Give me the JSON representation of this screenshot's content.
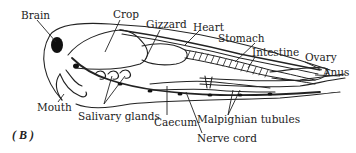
{
  "figure": {
    "panel_label": "( B )"
  },
  "labels": {
    "brain": "Brain",
    "crop": "Crop",
    "gizzard": "Gizzard",
    "heart": "Heart",
    "stomach": "Stomach",
    "intestine": "Intestine",
    "ovary": "Ovary",
    "anus": "Anus",
    "mouth": "Mouth",
    "salivary_glands": "Salivary glands",
    "caecum": "Caecum",
    "nerve_cord": "Nerve cord",
    "malpighian_tubules": "Malpighian tubules"
  },
  "colors": {
    "ink": "#222222",
    "background": "#ffffff"
  }
}
